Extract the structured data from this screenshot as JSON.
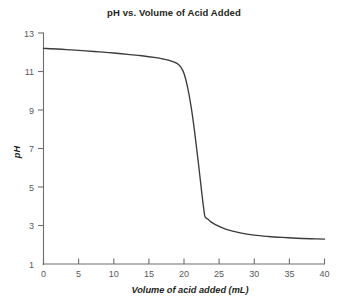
{
  "chart_data": {
    "type": "line",
    "title": "pH vs. Volume of Acid Added",
    "xlabel": "Volume of acid added (mL)",
    "ylabel": "pH",
    "xlim": [
      0,
      40
    ],
    "ylim": [
      1,
      13
    ],
    "xticks": [
      0,
      5,
      10,
      15,
      20,
      25,
      30,
      35,
      40
    ],
    "yticks": [
      1,
      3,
      5,
      7,
      9,
      11,
      13
    ],
    "xtick_labels": [
      "0",
      "5",
      "10",
      "15",
      "20",
      "25",
      "30",
      "35",
      "40"
    ],
    "ytick_labels": [
      "1",
      "3",
      "5",
      "7",
      "9",
      "11",
      "13"
    ],
    "grid": false,
    "legend": false,
    "legend_position": "none",
    "series": [
      {
        "name": "Titration curve",
        "color": "#3b3b3d",
        "x": [
          0,
          2,
          4,
          6,
          8,
          10,
          12,
          14,
          16,
          17,
          18,
          19,
          19.5,
          20,
          20.5,
          21,
          21.5,
          22,
          22.5,
          22.8,
          23,
          23.5,
          24,
          25,
          26,
          28,
          30,
          32,
          34,
          36,
          38,
          40
        ],
        "y": [
          12.2,
          12.17,
          12.12,
          12.07,
          12.02,
          11.96,
          11.89,
          11.82,
          11.72,
          11.65,
          11.56,
          11.42,
          11.25,
          10.9,
          10.2,
          9.2,
          7.9,
          6.4,
          4.8,
          3.9,
          3.45,
          3.3,
          3.15,
          2.95,
          2.8,
          2.62,
          2.5,
          2.43,
          2.38,
          2.34,
          2.31,
          2.29
        ]
      }
    ],
    "annotations": []
  },
  "axes": {
    "title": "pH vs. Volume of Acid Added",
    "x_title": "Volume of acid added (mL)",
    "y_title": "pH"
  },
  "colors": {
    "curve": "#3b3b3d",
    "axis": "#6d6e71",
    "text": "#231f20",
    "tick_text": "#58595b",
    "background": "#ffffff"
  }
}
